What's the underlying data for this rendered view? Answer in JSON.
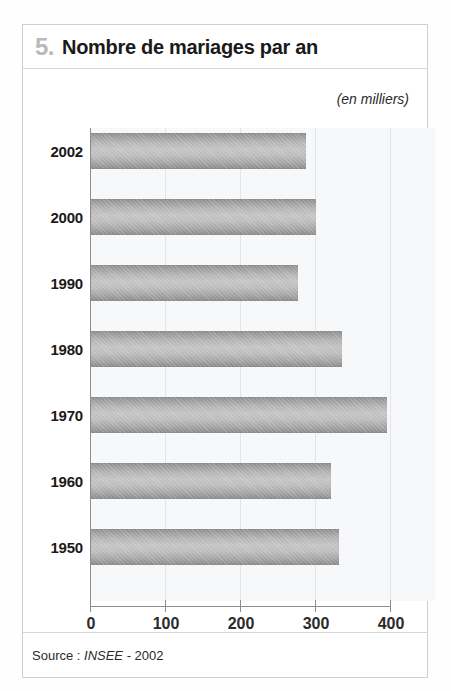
{
  "card": {
    "title_number": "5.",
    "title_text": "Nombre de mariages par an",
    "source_prefix": "Source : ",
    "source_org": "INSEE",
    "source_suffix": " - 2002"
  },
  "chart_data": {
    "type": "bar",
    "orientation": "horizontal",
    "title": "Nombre de mariages par an",
    "subtitle": "(en milliers)",
    "unit_note": "(en milliers)",
    "categories": [
      "2002",
      "2000",
      "1990",
      "1980",
      "1970",
      "1960",
      "1950"
    ],
    "values": [
      287,
      300,
      276,
      334,
      394,
      320,
      331
    ],
    "xlabel": "",
    "ylabel": "",
    "xlim": [
      0,
      400
    ],
    "xticks": [
      0,
      100,
      200,
      300,
      400
    ],
    "xtick_labels": [
      "0",
      "100",
      "200",
      "300",
      "400"
    ],
    "grid": true,
    "legend": false,
    "series": [
      {
        "name": "Nombre de mariages",
        "values": [
          287,
          300,
          276,
          334,
          394,
          320,
          331
        ]
      }
    ],
    "colors": {
      "bar_light": "#c4c4c4",
      "bar_dark": "#8a8a8a",
      "plot_background": "#f7f8f9",
      "axis": "#8d8d8d",
      "grid": "#e3e5e7",
      "title_number": "#b9b9b9",
      "text": "#1a1a1a"
    }
  }
}
